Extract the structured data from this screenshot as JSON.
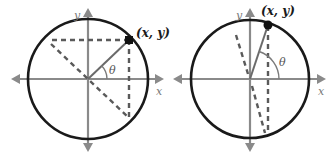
{
  "figure": {
    "colors": {
      "circle": "#1a1a1a",
      "axes": "#8a8a8a",
      "dashed": "#5a5a5a",
      "point": "#111111"
    },
    "diagrams": [
      {
        "id": "left",
        "point_label": "(x, y)",
        "x_axis_label": "x",
        "y_axis_label": "y",
        "angle_label": "θ",
        "angle_approx_deg": 45
      },
      {
        "id": "right",
        "point_label": "(x, y)",
        "x_axis_label": "x",
        "y_axis_label": "y",
        "angle_label": "θ",
        "angle_approx_deg": 72
      }
    ]
  }
}
